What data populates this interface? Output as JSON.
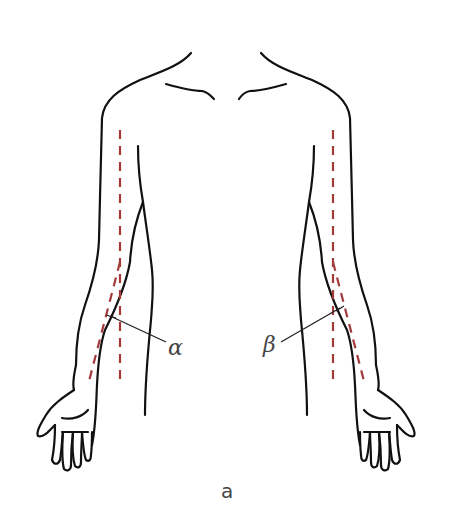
{
  "figure": {
    "panel_label": "a",
    "angle_left_label": "α",
    "angle_right_label": "β",
    "colors": {
      "outline": "#111111",
      "axis_dashed": "#a33a3a",
      "text": "#444444",
      "background": "#ffffff"
    },
    "annotations": [
      {
        "name": "carrying-angle-left",
        "symbol": "α",
        "side": "left arm"
      },
      {
        "name": "carrying-angle-right",
        "symbol": "β",
        "side": "right arm"
      }
    ]
  }
}
